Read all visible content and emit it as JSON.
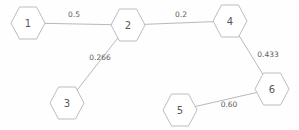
{
  "chart_data": {
    "type": "diagram",
    "subtype": "weighted-graph",
    "title": "",
    "directed": false,
    "background_color": "#fefefe",
    "node_stroke_color": "#b5b5b5",
    "node_fill_color": "#ffffff",
    "edge_color": "#b0b0b0",
    "label_color": "#585858",
    "node_shape": "hexagon",
    "nodes": [
      {
        "id": "1",
        "label": "1",
        "x": 28,
        "y": 23,
        "rx": 17,
        "ry": 16
      },
      {
        "id": "2",
        "label": "2",
        "x": 128,
        "y": 25,
        "rx": 17,
        "ry": 16
      },
      {
        "id": "3",
        "label": "3",
        "x": 67,
        "y": 103,
        "rx": 17,
        "ry": 16
      },
      {
        "id": "4",
        "label": "4",
        "x": 230,
        "y": 21,
        "rx": 17,
        "ry": 16
      },
      {
        "id": "5",
        "label": "5",
        "x": 180,
        "y": 110,
        "rx": 17,
        "ry": 16
      },
      {
        "id": "6",
        "label": "6",
        "x": 272,
        "y": 89,
        "rx": 17,
        "ry": 16
      }
    ],
    "edges": [
      {
        "source": "1",
        "target": "2",
        "weight": "0.5",
        "value": 0.5,
        "label_x": 74,
        "label_y": 14
      },
      {
        "source": "2",
        "target": "3",
        "weight": "0.266",
        "value": 0.266,
        "label_x": 100,
        "label_y": 57
      },
      {
        "source": "2",
        "target": "4",
        "weight": "0.2",
        "value": 0.2,
        "label_x": 181,
        "label_y": 14
      },
      {
        "source": "4",
        "target": "6",
        "weight": "0.433",
        "value": 0.433,
        "label_x": 268,
        "label_y": 54
      },
      {
        "source": "5",
        "target": "6",
        "weight": "0.60",
        "value": 0.6,
        "label_x": 229,
        "label_y": 104
      }
    ]
  }
}
